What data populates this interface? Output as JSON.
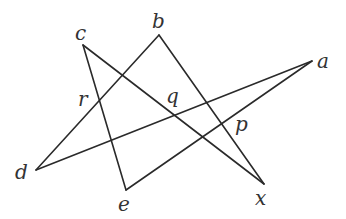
{
  "diagram": {
    "type": "line-arrangement",
    "vertices": {
      "a": {
        "x": 312,
        "y": 61
      },
      "b": {
        "x": 159,
        "y": 35
      },
      "c": {
        "x": 83,
        "y": 45
      },
      "d": {
        "x": 36,
        "y": 170
      },
      "e": {
        "x": 126,
        "y": 190
      },
      "x": {
        "x": 264,
        "y": 184
      }
    },
    "segments": [
      {
        "from": "c",
        "to": "x"
      },
      {
        "from": "c",
        "to": "e"
      },
      {
        "from": "d",
        "to": "b"
      },
      {
        "from": "b",
        "to": "x"
      },
      {
        "from": "d",
        "to": "a"
      },
      {
        "from": "e",
        "to": "a"
      }
    ],
    "labels": [
      {
        "id": "a",
        "text": "a",
        "x": 317,
        "y": 68
      },
      {
        "id": "b",
        "text": "b",
        "x": 152,
        "y": 28
      },
      {
        "id": "c",
        "text": "c",
        "x": 75,
        "y": 40
      },
      {
        "id": "d",
        "text": "d",
        "x": 15,
        "y": 179
      },
      {
        "id": "e",
        "text": "e",
        "x": 118,
        "y": 211
      },
      {
        "id": "x",
        "text": "x",
        "x": 255,
        "y": 205
      },
      {
        "id": "r",
        "text": "r",
        "x": 78,
        "y": 106
      },
      {
        "id": "q",
        "text": "q",
        "x": 166,
        "y": 103
      },
      {
        "id": "p",
        "text": "p",
        "x": 235,
        "y": 131
      }
    ],
    "line_color": "#2a2a2a",
    "label_color": "#333333"
  }
}
